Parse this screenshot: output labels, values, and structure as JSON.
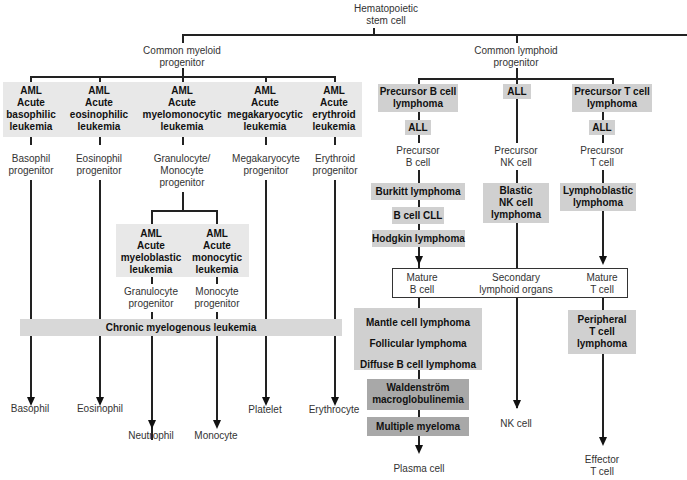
{
  "root": {
    "line1": "Hematopoietic",
    "line2": "stem cell"
  },
  "myeloid": {
    "title1": "Common myeloid",
    "title2": "progenitor",
    "leukemias": [
      {
        "l1": "AML",
        "l2": "Acute",
        "l3": "basophilic",
        "l4": "leukemia"
      },
      {
        "l1": "AML",
        "l2": "Acute",
        "l3": "eosinophilic",
        "l4": "leukemia"
      },
      {
        "l1": "AML",
        "l2": "Acute",
        "l3": "myelomonocytic",
        "l4": "leukemia"
      },
      {
        "l1": "AML",
        "l2": "Acute",
        "l3": "megakaryocytic",
        "l4": "leukemia"
      },
      {
        "l1": "AML",
        "l2": "Acute",
        "l3": "erythroid",
        "l4": "leukemia"
      }
    ],
    "progenitors": [
      {
        "l1": "Basophil",
        "l2": "progenitor"
      },
      {
        "l1": "Eosinophil",
        "l2": "progenitor"
      },
      {
        "l1": "Granulocyte/",
        "l2": "Monocyte",
        "l3": "progenitor"
      },
      {
        "l1": "Megakaryocyte",
        "l2": "progenitor"
      },
      {
        "l1": "Erythroid",
        "l2": "progenitor"
      }
    ],
    "sub_leukemias": [
      {
        "l1": "AML",
        "l2": "Acute",
        "l3": "myeloblastic",
        "l4": "leukemia"
      },
      {
        "l1": "AML",
        "l2": "Acute",
        "l3": "monocytic",
        "l4": "leukemia"
      }
    ],
    "sub_progenitors": [
      {
        "l1": "Granulocyte",
        "l2": "progenitor"
      },
      {
        "l1": "Monocyte",
        "l2": "progenitor"
      }
    ],
    "cml": "Chronic myelogenous leukemia",
    "mature": [
      "Basophil",
      "Eosinophil",
      "Neutrophil",
      "Monocyte",
      "Platelet",
      "Erythrocyte"
    ]
  },
  "lymphoid": {
    "title1": "Common lymphoid",
    "title2": "progenitor",
    "b": {
      "top1": "Precursor B cell",
      "top2": "lymphoma",
      "all": "ALL",
      "prec1": "Precursor",
      "prec2": "B cell",
      "burkitt": "Burkitt lymphoma",
      "cll": "B cell CLL",
      "hodgkin": "Hodgkin lymphoma",
      "mantle": "Mantle cell lymphoma",
      "follicular": "Follicular lymphoma",
      "diffuse": "Diffuse B cell lymphoma",
      "wald1": "Waldenström",
      "wald2": "macroglobulinemia",
      "myeloma": "Multiple myeloma",
      "plasma": "Plasma cell"
    },
    "nk": {
      "all": "ALL",
      "prec1": "Precursor",
      "prec2": "NK cell",
      "blastic1": "Blastic",
      "blastic2": "NK cell",
      "blastic3": "lymphoma",
      "mature": "NK cell"
    },
    "t": {
      "top1": "Precursor T cell",
      "top2": "lymphoma",
      "all": "ALL",
      "prec1": "Precursor",
      "prec2": "T cell",
      "lympho1": "Lymphoblastic",
      "lympho2": "lymphoma",
      "periph1": "Peripheral",
      "periph2": "T cell",
      "periph3": "lymphoma",
      "eff1": "Effector",
      "eff2": "T cell"
    },
    "secondary": {
      "matureB1": "Mature",
      "matureB2": "B cell",
      "organs1": "Secondary",
      "organs2": "lymphoid organs",
      "matureT1": "Mature",
      "matureT2": "T cell"
    }
  },
  "colors": {
    "light_box": "#e8e8e8",
    "mid_box": "#d0d0d0",
    "dark_box": "#a8a8a8",
    "line": "#222222"
  }
}
